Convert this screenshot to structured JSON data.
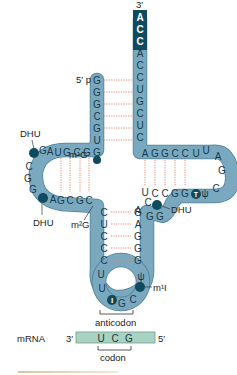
{
  "figure": {
    "colors": {
      "strand": "#7aa9bf",
      "strand_edge": "#4b7f96",
      "terminal": "#0f4a5e",
      "hydrogen_bond": "#e28a74",
      "mrna": "#a9d2c3"
    },
    "ends": {
      "three_prime": "3′",
      "five_prime": "5′ p"
    },
    "acceptor": {
      "terminal_bases": [
        "A",
        "C",
        "C"
      ],
      "unpaired": "A",
      "left_strand": [
        "G",
        "G",
        "G",
        "C",
        "G",
        "U",
        "G"
      ],
      "right_strand": [
        "C",
        "C",
        "U",
        "G",
        "C",
        "U",
        "C"
      ]
    },
    "d_arm": {
      "top_strand": [
        "G",
        "C",
        "G",
        "U",
        "A",
        "G"
      ],
      "loop": [
        "C",
        "G",
        "G"
      ],
      "bottom_strand": [
        "A",
        "G",
        "C",
        "G",
        "C"
      ]
    },
    "t_arm": {
      "top_strand": [
        "A",
        "G",
        "G",
        "C",
        "C"
      ],
      "loop": [
        "U",
        "U",
        "A",
        "G",
        "C"
      ],
      "bottom_strand": [
        "U",
        "C",
        "C",
        "G",
        "G"
      ],
      "modified": [
        "T",
        "ψ"
      ],
      "connector": [
        "C",
        "A",
        "G",
        "G"
      ]
    },
    "anticodon_arm": {
      "left_strand": [
        "C",
        "U",
        "C",
        "C",
        "C"
      ],
      "right_strand": [
        "G",
        "A",
        "G",
        "G",
        "G"
      ],
      "loop": [
        "U",
        "U",
        "I",
        "G",
        "C",
        "ψ"
      ],
      "anticodon": [
        "I",
        "G",
        "C"
      ]
    },
    "labels": {
      "m1G": "m¹G",
      "m2G": "m²G",
      "dhu_top": "DHU",
      "dhu_bottom": "DHU",
      "dhu_right": "DHU",
      "m1I": "m¹I",
      "anticodon": "anticodon",
      "codon": "codon",
      "mrna": "mRNA"
    },
    "mrna": {
      "three_prime": "3′",
      "five_prime": "5′",
      "codon_bases": [
        "U",
        "C",
        "G"
      ]
    }
  }
}
